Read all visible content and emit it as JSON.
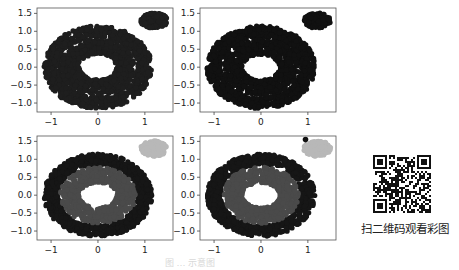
{
  "chart_data": [
    {
      "type": "scatter",
      "panel": "top-left",
      "title": "",
      "xlabel": "",
      "ylabel": "",
      "xlim": [
        -1.3,
        1.6
      ],
      "ylim": [
        -1.25,
        1.65
      ],
      "xticks": [
        "-1",
        "0",
        "1"
      ],
      "yticks": [
        "1.5",
        "1.0",
        "0.5",
        "0.0",
        "-0.5",
        "-1.0"
      ],
      "grid": false,
      "clusters": [
        {
          "shape": "outer-ring",
          "center": [
            0,
            0
          ],
          "radius_x": [
            0.85,
            1.15
          ],
          "radius_y": [
            0.85,
            1.15
          ],
          "color": "#1e1e1e"
        },
        {
          "shape": "inner-ring",
          "center": [
            0,
            0
          ],
          "radius_x": [
            0.4,
            0.8
          ],
          "radius_y": [
            0.35,
            0.78
          ],
          "color": "#1e1e1e"
        },
        {
          "shape": "blob",
          "center": [
            1.2,
            1.3
          ],
          "radius": 0.25,
          "color": "#1e1e1e"
        }
      ]
    },
    {
      "type": "scatter",
      "panel": "top-right",
      "title": "",
      "xlabel": "",
      "ylabel": "",
      "xlim": [
        -1.3,
        1.6
      ],
      "ylim": [
        -1.25,
        1.65
      ],
      "xticks": [
        "-1",
        "0",
        "1"
      ],
      "yticks": [
        "1.5",
        "1.0",
        "0.5",
        "0.0",
        "-0.5",
        "-1.0"
      ],
      "grid": false,
      "clusters": [
        {
          "shape": "outer-ring",
          "center": [
            0,
            0
          ],
          "radius_x": [
            0.85,
            1.15
          ],
          "radius_y": [
            0.85,
            1.15
          ],
          "color": "#111111"
        },
        {
          "shape": "inner-ring",
          "center": [
            0,
            0
          ],
          "radius_x": [
            0.4,
            0.8
          ],
          "radius_y": [
            0.35,
            0.78
          ],
          "color": "#111111"
        },
        {
          "shape": "blob",
          "center": [
            1.2,
            1.3
          ],
          "radius": 0.25,
          "color": "#111111"
        }
      ]
    },
    {
      "type": "scatter",
      "panel": "bottom-left",
      "title": "",
      "xlabel": "",
      "ylabel": "",
      "xlim": [
        -1.3,
        1.6
      ],
      "ylim": [
        -1.25,
        1.65
      ],
      "xticks": [
        "-1",
        "0",
        "1"
      ],
      "yticks": [
        "1.5",
        "1.0",
        "0.5",
        "0.0",
        "-0.5",
        "-1.0"
      ],
      "grid": false,
      "clusters": [
        {
          "shape": "outer-ring",
          "center": [
            0,
            0
          ],
          "radius_x": [
            0.85,
            1.15
          ],
          "radius_y": [
            0.85,
            1.15
          ],
          "color": "#161616"
        },
        {
          "shape": "inner-ring",
          "center": [
            0,
            0
          ],
          "radius_x": [
            0.4,
            0.8
          ],
          "radius_y": [
            0.35,
            0.78
          ],
          "color": "#4a4a4a"
        },
        {
          "shape": "blob",
          "center": [
            1.2,
            1.3
          ],
          "radius": 0.25,
          "color": "#b8b8b8"
        }
      ]
    },
    {
      "type": "scatter",
      "panel": "bottom-right",
      "title": "",
      "xlabel": "",
      "ylabel": "",
      "xlim": [
        -1.3,
        1.6
      ],
      "ylim": [
        -1.25,
        1.65
      ],
      "xticks": [
        "-1",
        "0",
        "1"
      ],
      "yticks": [
        "1.5",
        "1.0",
        "0.5",
        "0.0",
        "-0.5",
        "-1.0"
      ],
      "grid": false,
      "clusters": [
        {
          "shape": "outer-ring",
          "center": [
            0,
            0
          ],
          "radius_x": [
            0.85,
            1.15
          ],
          "radius_y": [
            0.85,
            1.15
          ],
          "color": "#161616"
        },
        {
          "shape": "inner-ring",
          "center": [
            0,
            0
          ],
          "radius_x": [
            0.4,
            0.8
          ],
          "radius_y": [
            0.35,
            0.78
          ],
          "color": "#4a4a4a"
        },
        {
          "shape": "blob",
          "center": [
            1.2,
            1.3
          ],
          "radius": 0.25,
          "color": "#b8b8b8"
        },
        {
          "shape": "point",
          "center": [
            0.95,
            1.55
          ],
          "radius": 0.05,
          "color": "#111111"
        }
      ]
    }
  ],
  "qr": {
    "caption": "扫二维码观看彩图"
  },
  "figure": {
    "caption": "图 …  示意图"
  }
}
